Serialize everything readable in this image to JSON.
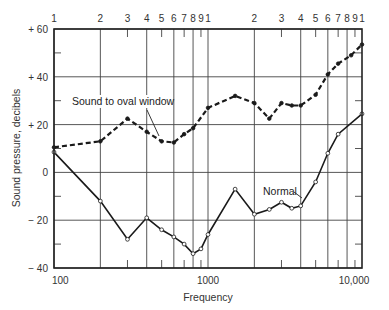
{
  "chart_data": {
    "type": "line",
    "title": "",
    "xlabel": "Frequency",
    "ylabel": "Sound pressure, decibels",
    "xscale": "log",
    "xlim": [
      100,
      10000
    ],
    "ylim": [
      -40,
      60
    ],
    "grid": true,
    "x_tick_labels": [
      "100",
      "1000",
      "10,000"
    ],
    "y_tick_labels": [
      "+ 60",
      "+ 40",
      "+ 20",
      "0",
      "− 20",
      "− 40"
    ],
    "y_ticks": [
      60,
      40,
      20,
      0,
      -20,
      -40
    ],
    "top_axis_labels": [
      "1",
      "2",
      "3",
      "4",
      "5",
      "6",
      "7",
      "8",
      "9",
      "1",
      "2",
      "3",
      "4",
      "5",
      "6",
      "7",
      "8",
      "9",
      "1"
    ],
    "series": [
      {
        "name": "Sound to oval window",
        "style": "dashed",
        "x": [
          100,
          200,
          300,
          400,
          500,
          600,
          700,
          800,
          1000,
          1500,
          2000,
          2500,
          3000,
          3500,
          4000,
          5000,
          6000,
          7000,
          8500,
          10000
        ],
        "values": [
          10.5,
          13,
          22.5,
          17,
          13,
          12.5,
          16,
          18.5,
          27,
          32,
          29,
          22.5,
          29,
          28,
          28,
          32.5,
          41,
          45.5,
          49,
          53.5
        ]
      },
      {
        "name": "Normal",
        "style": "solid",
        "x": [
          100,
          200,
          300,
          400,
          500,
          600,
          700,
          800,
          900,
          1000,
          1500,
          2000,
          2500,
          3000,
          3500,
          4000,
          5000,
          6000,
          7000,
          10000
        ],
        "values": [
          8.5,
          -12,
          -28,
          -19,
          -24,
          -27,
          -30,
          -34,
          -32,
          -26,
          -7,
          -17.5,
          -15.5,
          -12.5,
          -15,
          -14,
          -4,
          8,
          16,
          24.5
        ]
      }
    ],
    "annotations": [
      {
        "text": "Sound to oval window",
        "points_to": "dashed series near 500 Hz"
      },
      {
        "text": "Normal",
        "points_to": "solid series near 4000 Hz"
      }
    ],
    "legend": "none (inline annotations)"
  }
}
